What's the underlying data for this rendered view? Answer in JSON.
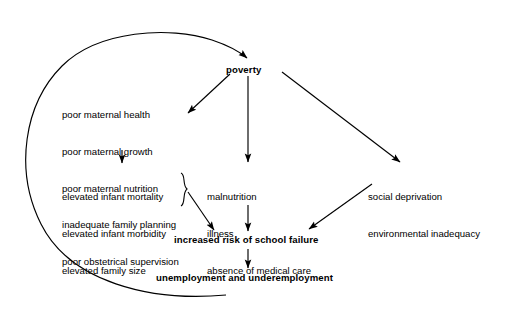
{
  "diagram": {
    "type": "causal-loop-flowchart",
    "title": "",
    "background_color": "#ffffff",
    "line_color": "#000000",
    "nodes": {
      "poverty": {
        "label": "poverty",
        "bold": true
      },
      "maternal_factors": {
        "bold": false,
        "lines": [
          "poor maternal health",
          "poor maternal growth",
          "poor maternal nutrition",
          "inadequate family planning",
          "poor obstetrical supervision"
        ]
      },
      "infant_outcomes": {
        "bold": false,
        "lines": [
          "elevated infant mortality",
          "elevated infant morbidity",
          "elevated family size"
        ]
      },
      "health_deficits": {
        "bold": false,
        "lines": [
          "malnutrition",
          "illness",
          "absence of medical care"
        ]
      },
      "environment": {
        "bold": false,
        "lines": [
          "social deprivation",
          "environmental inadequacy"
        ]
      },
      "school_failure": {
        "label": "increased risk of school failure",
        "bold": true
      },
      "unemployment": {
        "label": "unemployment and underemployment",
        "bold": true
      }
    },
    "edges": [
      {
        "from": "poverty",
        "to": "maternal_factors",
        "style": "straight-arrow"
      },
      {
        "from": "poverty",
        "to": "health_deficits",
        "style": "straight-arrow"
      },
      {
        "from": "poverty",
        "to": "environment",
        "style": "straight-arrow"
      },
      {
        "from": "maternal_factors",
        "to": "infant_outcomes",
        "style": "straight-arrow"
      },
      {
        "from": "infant_outcomes",
        "to": "school_failure",
        "style": "brace-arrow"
      },
      {
        "from": "health_deficits",
        "to": "school_failure",
        "style": "straight-arrow"
      },
      {
        "from": "environment",
        "to": "school_failure",
        "style": "straight-arrow"
      },
      {
        "from": "school_failure",
        "to": "unemployment",
        "style": "straight-arrow"
      },
      {
        "from": "unemployment",
        "to": "poverty",
        "style": "curved-feedback-arrow"
      }
    ]
  }
}
